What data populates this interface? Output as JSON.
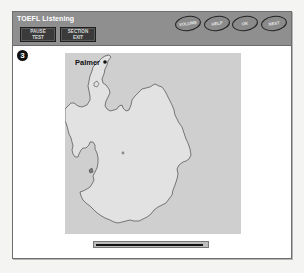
{
  "header": {
    "title": "TOEFL Listening",
    "buttons": {
      "pause_test": {
        "line1": "PAUSE",
        "line2": "TEST"
      },
      "section_exit": {
        "line1": "SECTION",
        "line2": "EXIT"
      },
      "volume": "VOLUME",
      "help": "HELP",
      "ok": "OK",
      "next": "NEXT"
    }
  },
  "question": {
    "number": "3"
  },
  "map": {
    "label": "Palmer",
    "description": "Map of Antarctica with Palmer Station marked on the Antarctic Peninsula",
    "colors": {
      "background": "#cfcfcf",
      "land": "#e2e2e2",
      "coast": "#555555"
    }
  },
  "progress": {
    "fraction": 0.97
  }
}
